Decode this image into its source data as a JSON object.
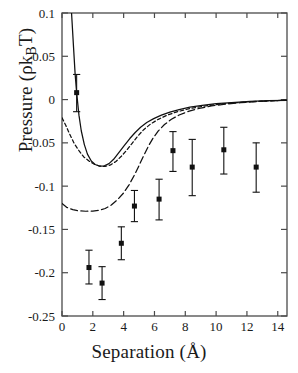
{
  "chart_data": {
    "type": "scatter",
    "title": "",
    "xlabel": "Separation (Å)",
    "ylabel": "Pressure (ρk_BT)",
    "ylabel_parts": {
      "prefix": "Pressure (",
      "rho": "ρ",
      "k": "k",
      "sub": "B",
      "t": "T",
      "suffix": ")"
    },
    "xlim": [
      0,
      14.6
    ],
    "ylim": [
      -0.25,
      0.1
    ],
    "xticks": [
      0,
      2,
      4,
      6,
      8,
      10,
      12,
      14
    ],
    "xticklabels": [
      "0",
      "2",
      "4",
      "6",
      "8",
      "10",
      "12",
      "14"
    ],
    "yticks": [
      0.1,
      0.05,
      0,
      -0.05,
      -0.1,
      -0.15,
      -0.2,
      -0.25
    ],
    "yticklabels": [
      "0.1",
      "0.05",
      "0",
      "-0.05",
      "-0.1",
      "-0.15",
      "-0.2",
      "-0.25"
    ],
    "grid": false,
    "legend": "none",
    "series": [
      {
        "name": "measured-pressure",
        "type": "scatter",
        "marker": "square",
        "color": "#111111",
        "points": [
          {
            "x": 0.95,
            "y": 0.008,
            "yerr_low": 0.022,
            "yerr_high": 0.021
          },
          {
            "x": 1.75,
            "y": -0.194,
            "yerr_low": 0.019,
            "yerr_high": 0.02
          },
          {
            "x": 2.6,
            "y": -0.212,
            "yerr_low": 0.019,
            "yerr_high": 0.019
          },
          {
            "x": 3.85,
            "y": -0.166,
            "yerr_low": 0.019,
            "yerr_high": 0.019
          },
          {
            "x": 4.7,
            "y": -0.123,
            "yerr_low": 0.018,
            "yerr_high": 0.018
          },
          {
            "x": 6.3,
            "y": -0.115,
            "yerr_low": 0.024,
            "yerr_high": 0.023
          },
          {
            "x": 7.2,
            "y": -0.059,
            "yerr_low": 0.024,
            "yerr_high": 0.022
          },
          {
            "x": 8.45,
            "y": -0.078,
            "yerr_low": 0.033,
            "yerr_high": 0.032
          },
          {
            "x": 10.5,
            "y": -0.058,
            "yerr_low": 0.028,
            "yerr_high": 0.026
          },
          {
            "x": 12.6,
            "y": -0.078,
            "yerr_low": 0.029,
            "yerr_high": 0.028
          }
        ]
      },
      {
        "name": "solid-theory-curve",
        "type": "line",
        "style": "solid",
        "color": "#111111",
        "points": [
          [
            0.62,
            0.1
          ],
          [
            0.75,
            0.06
          ],
          [
            0.85,
            0.03
          ],
          [
            0.95,
            0.008
          ],
          [
            1.1,
            -0.018
          ],
          [
            1.25,
            -0.036
          ],
          [
            1.45,
            -0.052
          ],
          [
            1.65,
            -0.063
          ],
          [
            1.9,
            -0.071
          ],
          [
            2.15,
            -0.075
          ],
          [
            2.45,
            -0.077
          ],
          [
            2.75,
            -0.0765
          ],
          [
            3.05,
            -0.074
          ],
          [
            3.35,
            -0.069
          ],
          [
            3.7,
            -0.061
          ],
          [
            4.05,
            -0.053
          ],
          [
            4.4,
            -0.045
          ],
          [
            4.75,
            -0.038
          ],
          [
            5.1,
            -0.032
          ],
          [
            5.5,
            -0.0265
          ],
          [
            5.95,
            -0.022
          ],
          [
            6.45,
            -0.018
          ],
          [
            7.0,
            -0.0145
          ],
          [
            7.6,
            -0.0115
          ],
          [
            8.3,
            -0.0088
          ],
          [
            9.1,
            -0.0066
          ],
          [
            10.0,
            -0.0048
          ],
          [
            11.0,
            -0.0034
          ],
          [
            12.2,
            -0.0022
          ],
          [
            13.4,
            -0.0013
          ],
          [
            14.6,
            -0.0008
          ]
        ]
      },
      {
        "name": "short-dashed-theory-curve",
        "type": "line",
        "style": "dashed-short",
        "color": "#111111",
        "points": [
          [
            0.0,
            -0.021
          ],
          [
            0.25,
            -0.03
          ],
          [
            0.5,
            -0.04
          ],
          [
            0.8,
            -0.051
          ],
          [
            1.1,
            -0.059
          ],
          [
            1.4,
            -0.066
          ],
          [
            1.75,
            -0.071
          ],
          [
            2.1,
            -0.0748
          ],
          [
            2.45,
            -0.0768
          ],
          [
            2.8,
            -0.0772
          ],
          [
            3.15,
            -0.0755
          ],
          [
            3.5,
            -0.0715
          ],
          [
            3.85,
            -0.0655
          ],
          [
            4.2,
            -0.0585
          ],
          [
            4.55,
            -0.0505
          ],
          [
            4.9,
            -0.0425
          ],
          [
            5.3,
            -0.0348
          ],
          [
            5.75,
            -0.0282
          ],
          [
            6.25,
            -0.0228
          ],
          [
            6.8,
            -0.0182
          ],
          [
            7.45,
            -0.0142
          ],
          [
            8.2,
            -0.0108
          ],
          [
            9.05,
            -0.008
          ],
          [
            10.0,
            -0.0057
          ],
          [
            11.1,
            -0.0038
          ],
          [
            12.3,
            -0.0024
          ],
          [
            13.5,
            -0.0014
          ],
          [
            14.6,
            -0.0008
          ]
        ]
      },
      {
        "name": "long-dashed-theory-curve",
        "type": "line",
        "style": "dashed-long",
        "color": "#111111",
        "points": [
          [
            0.0,
            -0.12
          ],
          [
            0.3,
            -0.1245
          ],
          [
            0.7,
            -0.1272
          ],
          [
            1.1,
            -0.1285
          ],
          [
            1.55,
            -0.129
          ],
          [
            2.0,
            -0.1288
          ],
          [
            2.4,
            -0.128
          ],
          [
            2.8,
            -0.1258
          ],
          [
            3.2,
            -0.1218
          ],
          [
            3.6,
            -0.1158
          ],
          [
            4.0,
            -0.1078
          ],
          [
            4.35,
            -0.0985
          ],
          [
            4.7,
            -0.0872
          ],
          [
            5.0,
            -0.0762
          ],
          [
            5.3,
            -0.0648
          ],
          [
            5.6,
            -0.054
          ],
          [
            5.9,
            -0.0448
          ],
          [
            6.25,
            -0.0362
          ],
          [
            6.65,
            -0.0288
          ],
          [
            7.1,
            -0.0228
          ],
          [
            7.6,
            -0.0178
          ],
          [
            8.2,
            -0.0136
          ],
          [
            8.9,
            -0.0102
          ],
          [
            9.7,
            -0.0074
          ],
          [
            10.6,
            -0.0052
          ],
          [
            11.6,
            -0.0035
          ],
          [
            12.7,
            -0.0022
          ],
          [
            13.8,
            -0.0013
          ],
          [
            14.6,
            -0.0008
          ]
        ]
      }
    ]
  },
  "axes": {
    "frame_color": "#4a4a4a",
    "plot_left_px": 62,
    "plot_right_px": 287,
    "plot_top_px": 13,
    "plot_bottom_px": 316
  }
}
